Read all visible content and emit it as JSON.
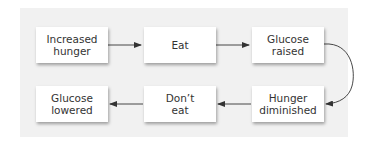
{
  "diagram": {
    "type": "flowchart",
    "nodes": [
      {
        "id": "n1",
        "label": "Increased\nhunger"
      },
      {
        "id": "n2",
        "label": "Eat"
      },
      {
        "id": "n3",
        "label": "Glucose\nraised"
      },
      {
        "id": "n4",
        "label": "Hunger\ndiminished"
      },
      {
        "id": "n5",
        "label": "Don’t\neat"
      },
      {
        "id": "n6",
        "label": "Glucose\nlowered"
      }
    ],
    "edges": [
      {
        "from": "n1",
        "to": "n2"
      },
      {
        "from": "n2",
        "to": "n3"
      },
      {
        "from": "n3",
        "to": "n4"
      },
      {
        "from": "n4",
        "to": "n5"
      },
      {
        "from": "n5",
        "to": "n6"
      }
    ],
    "colors": {
      "panel": "#f1f1f1",
      "box": "#ffffff",
      "text": "#333333",
      "arrow": "#333333"
    }
  }
}
